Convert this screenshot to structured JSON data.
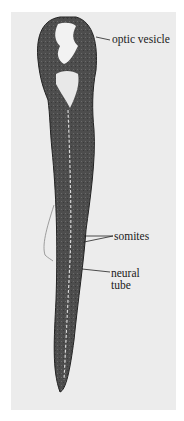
{
  "figure": {
    "background_color": "#ececec",
    "tissue_color": "#4a4a4a"
  },
  "labels": [
    {
      "id": "optic_vesicle",
      "text": "optic vesicle"
    },
    {
      "id": "somites",
      "text": "somites"
    },
    {
      "id": "neural_tube_line1",
      "text": "neural"
    },
    {
      "id": "neural_tube_line2",
      "text": "tube"
    }
  ]
}
